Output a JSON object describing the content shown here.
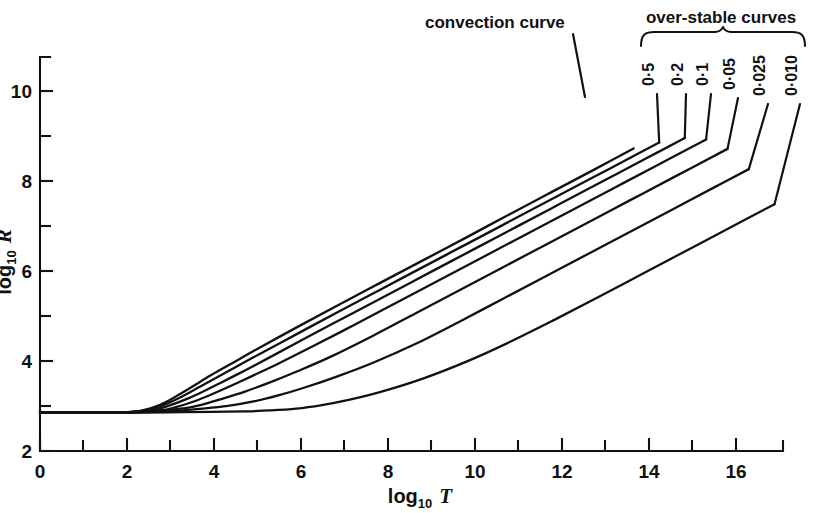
{
  "figure": {
    "background_color": "#ffffff",
    "ink_color": "#111111"
  },
  "axes": {
    "x": {
      "title_main": "log",
      "title_sub": "10",
      "title_var": "T",
      "tick_labels": [
        "0",
        "2",
        "4",
        "6",
        "8",
        "10",
        "12",
        "14",
        "16"
      ],
      "tick_values": [
        0,
        2,
        4,
        6,
        8,
        10,
        12,
        14,
        16
      ],
      "minor_tick_values": [
        1,
        3,
        5,
        7,
        9,
        11,
        13,
        15,
        17
      ],
      "range": [
        0,
        17.4
      ]
    },
    "y": {
      "title_main": "log",
      "title_sub": "10",
      "title_var": "R",
      "tick_labels": [
        "2",
        "4",
        "6",
        "8",
        "10"
      ],
      "tick_values": [
        2,
        4,
        6,
        8,
        10
      ],
      "minor_tick_values": [
        3,
        5,
        7,
        9,
        11
      ],
      "range": [
        2,
        10.75
      ]
    }
  },
  "annotations": {
    "convection_label": "convection curve",
    "overstable_group_label": "over-stable curves"
  },
  "chart_data": {
    "type": "line",
    "title": "",
    "subtitle": "",
    "xlabel": "log10 T",
    "ylabel": "log10 R",
    "xlim": [
      0,
      17.4
    ],
    "ylim": [
      2,
      10.75
    ],
    "grid": false,
    "legend_position": "top-right-bracket",
    "notes": [
      "All curves coincide on a flat branch at log10 R = 2.85 for log10 T < 2.6",
      "Curves diverge near log10 T = 2.8 and become straight with slope ~0.5 at large log10 T",
      "Top-most branch is the convection curve; the remaining six are over-stable curves labelled by parameter value"
    ],
    "series": [
      {
        "name": "convection curve",
        "label": "convection curve",
        "kind": "convection",
        "x": [
          0,
          1,
          2,
          2.4,
          2.8,
          3.2,
          3.6,
          4.0,
          4.5,
          5.0,
          6.0,
          7.0,
          8.0,
          9.0,
          10.0,
          11.0,
          12.0,
          13.0,
          13.9
        ],
        "y": [
          2.85,
          2.85,
          2.86,
          2.9,
          3.02,
          3.22,
          3.45,
          3.68,
          3.95,
          4.22,
          4.74,
          5.25,
          5.75,
          6.25,
          6.75,
          7.26,
          7.76,
          8.26,
          8.72
        ]
      },
      {
        "name": "0·5",
        "label": "0·5",
        "kind": "over-stable",
        "value": 0.5,
        "x": [
          0,
          1,
          2,
          2.4,
          2.8,
          3.2,
          3.6,
          4.0,
          4.5,
          5.0,
          6.0,
          7.0,
          8.0,
          9.0,
          10.0,
          11.0,
          12.0,
          13.0,
          14.0,
          14.5
        ],
        "y": [
          2.85,
          2.85,
          2.86,
          2.89,
          2.99,
          3.15,
          3.35,
          3.56,
          3.82,
          4.08,
          4.59,
          5.1,
          5.6,
          6.1,
          6.6,
          7.1,
          7.6,
          8.1,
          8.6,
          8.85
        ]
      },
      {
        "name": "0·2",
        "label": "0·2",
        "kind": "over-stable",
        "value": 0.2,
        "x": [
          0,
          1,
          2,
          2.6,
          3.0,
          3.4,
          3.8,
          4.2,
          4.8,
          5.4,
          6.2,
          7.2,
          8.2,
          9.2,
          10.2,
          11.2,
          12.2,
          13.2,
          14.2,
          15.1
        ],
        "y": [
          2.85,
          2.85,
          2.86,
          2.9,
          3.0,
          3.14,
          3.31,
          3.5,
          3.79,
          4.09,
          4.5,
          5.0,
          5.5,
          6.0,
          6.5,
          7.0,
          7.5,
          8.0,
          8.5,
          8.95
        ]
      },
      {
        "name": "0·1",
        "label": "0·1",
        "kind": "over-stable",
        "value": 0.1,
        "x": [
          0,
          1,
          2,
          2.8,
          3.2,
          3.6,
          4.0,
          4.5,
          5.0,
          5.6,
          6.4,
          7.4,
          8.4,
          9.4,
          10.4,
          11.4,
          12.4,
          13.4,
          14.4,
          15.6
        ],
        "y": [
          2.85,
          2.85,
          2.86,
          2.9,
          2.98,
          3.1,
          3.25,
          3.46,
          3.68,
          3.95,
          4.33,
          4.82,
          5.32,
          5.82,
          6.32,
          6.82,
          7.32,
          7.82,
          8.32,
          8.92
        ]
      },
      {
        "name": "0·05",
        "label": "0·05",
        "kind": "over-stable",
        "value": 0.05,
        "x": [
          0,
          1,
          2,
          2.8,
          3.4,
          3.8,
          4.2,
          4.8,
          5.4,
          6.0,
          6.8,
          7.8,
          8.8,
          9.8,
          10.8,
          11.8,
          12.8,
          13.8,
          14.8,
          16.1
        ],
        "y": [
          2.85,
          2.85,
          2.86,
          2.89,
          2.95,
          3.03,
          3.14,
          3.32,
          3.53,
          3.76,
          4.09,
          4.56,
          5.06,
          5.56,
          6.06,
          6.56,
          7.06,
          7.56,
          8.06,
          8.71
        ]
      },
      {
        "name": "0·025",
        "label": "0·025",
        "kind": "over-stable",
        "value": 0.025,
        "x": [
          0,
          1,
          2,
          3.0,
          3.8,
          4.4,
          5.0,
          5.6,
          6.2,
          7.0,
          7.8,
          8.8,
          9.8,
          10.8,
          11.8,
          12.8,
          13.8,
          14.8,
          15.8,
          16.6
        ],
        "y": [
          2.85,
          2.85,
          2.86,
          2.88,
          2.94,
          3.0,
          3.1,
          3.24,
          3.41,
          3.67,
          3.96,
          4.38,
          4.86,
          5.36,
          5.86,
          6.36,
          6.86,
          7.36,
          7.86,
          8.26
        ]
      },
      {
        "name": "0·010",
        "label": "0·010",
        "kind": "over-stable",
        "value": 0.01,
        "x": [
          0,
          1,
          2,
          3.0,
          4.0,
          4.8,
          5.4,
          6.0,
          6.6,
          7.2,
          8.0,
          9.0,
          10.0,
          11.0,
          12.0,
          13.0,
          14.0,
          15.0,
          16.0,
          17.2
        ],
        "y": [
          2.85,
          2.85,
          2.85,
          2.86,
          2.87,
          2.88,
          2.9,
          2.94,
          3.02,
          3.13,
          3.32,
          3.62,
          3.99,
          4.42,
          4.89,
          5.38,
          5.88,
          6.38,
          6.88,
          7.48
        ]
      }
    ]
  },
  "curve_labels": [
    {
      "text": "0·5",
      "x": 654,
      "y": 86
    },
    {
      "text": "0·2",
      "x": 683,
      "y": 86
    },
    {
      "text": "0·1",
      "x": 708,
      "y": 86
    },
    {
      "text": "0·05",
      "x": 735,
      "y": 90
    },
    {
      "text": "0·025",
      "x": 765,
      "y": 96
    },
    {
      "text": "0·010",
      "x": 797,
      "y": 96
    }
  ]
}
